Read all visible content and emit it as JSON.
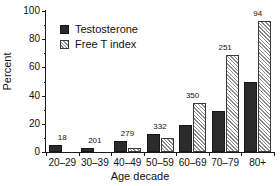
{
  "chart_data": {
    "type": "bar",
    "title": "",
    "xlabel": "Age decade",
    "ylabel": "Percent",
    "categories": [
      "20–29",
      "30–39",
      "40–49",
      "50–59",
      "60–69",
      "70–79",
      "80+"
    ],
    "series": [
      {
        "name": "Testosterone",
        "style": "solid-dark",
        "color": "#2b2b2b",
        "values": [
          5,
          3,
          8,
          12.5,
          19,
          29,
          50
        ]
      },
      {
        "name": "Free T index",
        "style": "hatched-white",
        "color": "#ffffff",
        "values": [
          0,
          0,
          3,
          10,
          35,
          69,
          93
        ]
      }
    ],
    "group_labels": [
      "18",
      "201",
      "279",
      "332",
      "350",
      "251",
      "94"
    ],
    "ylim": [
      0,
      100
    ],
    "yticks": [
      0,
      20,
      40,
      60,
      80,
      100
    ],
    "ytick_labels": [
      "0",
      "20",
      "40",
      "60",
      "80",
      "100"
    ],
    "yticks_minor": [
      10,
      30,
      50,
      70,
      90
    ],
    "grid": false,
    "legend_position": "top-left-inside"
  },
  "legend": {
    "items": [
      {
        "label": "Testosterone",
        "swatch": "solid"
      },
      {
        "label": "Free T index",
        "swatch": "hatch"
      }
    ]
  }
}
